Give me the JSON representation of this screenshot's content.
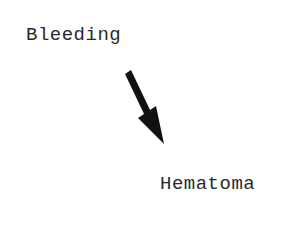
{
  "diagram": {
    "nodes": [
      {
        "id": "bleeding",
        "label": "Bleeding"
      },
      {
        "id": "hematoma",
        "label": "Hematoma"
      }
    ],
    "edges": [
      {
        "from": "bleeding",
        "to": "hematoma",
        "type": "arrow",
        "color": "#111111"
      }
    ]
  }
}
